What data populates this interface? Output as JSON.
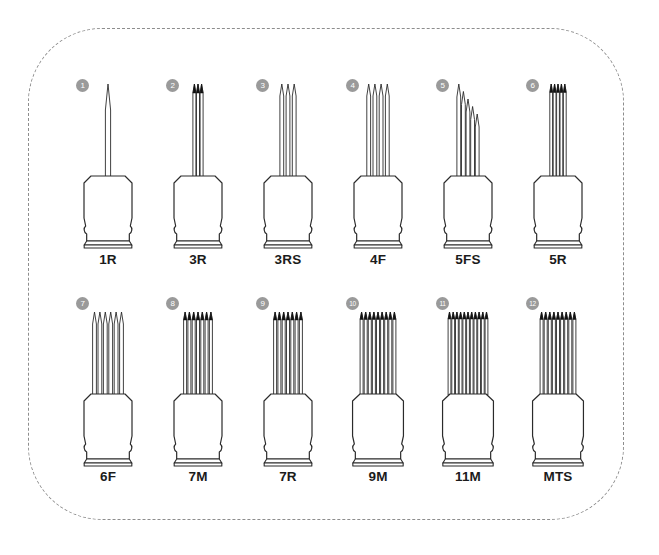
{
  "diagram": {
    "frame": {
      "style": "dashed-rounded-rectangle",
      "border_color": "#8d8d8d"
    },
    "colors": {
      "outline": "#2b2b2b",
      "badge_fill": "#9a9a9a",
      "badge_text": "#ffffff",
      "label_text": "#1b1b1b",
      "frame_dash": "#8d8d8d",
      "background": "#ffffff"
    },
    "rows": 2,
    "columns": 6,
    "items": [
      {
        "badge": "1",
        "label": "1R",
        "needle_count": 1,
        "arrangement": "round",
        "tip_style": "single-long-taper",
        "needle_length": "long"
      },
      {
        "badge": "2",
        "label": "3R",
        "needle_count": 3,
        "arrangement": "round",
        "tip_style": "grouped-dark-tips",
        "needle_length": "long"
      },
      {
        "badge": "3",
        "label": "3RS",
        "needle_count": 3,
        "arrangement": "round-shader",
        "tip_style": "open-taper",
        "needle_length": "long"
      },
      {
        "badge": "4",
        "label": "4F",
        "needle_count": 4,
        "arrangement": "flat",
        "tip_style": "open-taper",
        "needle_length": "long"
      },
      {
        "badge": "5",
        "label": "5FS",
        "needle_count": 5,
        "arrangement": "flat-stagger",
        "tip_style": "angled-stagger",
        "needle_length": "long"
      },
      {
        "badge": "6",
        "label": "5R",
        "needle_count": 5,
        "arrangement": "round",
        "tip_style": "grouped-dark-tips",
        "needle_length": "long"
      },
      {
        "badge": "7",
        "label": "6F",
        "needle_count": 6,
        "arrangement": "flat",
        "tip_style": "open-taper",
        "needle_length": "medium"
      },
      {
        "badge": "8",
        "label": "7M",
        "needle_count": 7,
        "arrangement": "magnum",
        "tip_style": "grouped-dark-tips",
        "needle_length": "medium"
      },
      {
        "badge": "9",
        "label": "7R",
        "needle_count": 7,
        "arrangement": "round",
        "tip_style": "grouped-dark-tips",
        "needle_length": "medium"
      },
      {
        "badge": "10",
        "label": "9M",
        "needle_count": 9,
        "arrangement": "magnum",
        "tip_style": "grouped-dark-tips",
        "needle_length": "medium"
      },
      {
        "badge": "11",
        "label": "11M",
        "needle_count": 11,
        "arrangement": "magnum",
        "tip_style": "grouped-dark-tips",
        "needle_length": "medium"
      },
      {
        "badge": "12",
        "label": "MTS",
        "needle_count": 9,
        "arrangement": "flat-micro",
        "tip_style": "grouped-dark-tips",
        "needle_length": "medium"
      }
    ]
  }
}
